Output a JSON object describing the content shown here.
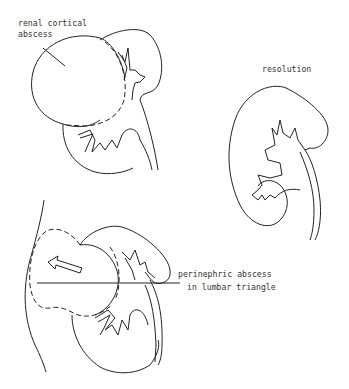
{
  "diagram": {
    "type": "medical illustration",
    "colors": {
      "line": "#222222",
      "text": "#333333",
      "background": "#ffffff"
    },
    "panels": [
      {
        "id": "top-left",
        "label": "renal cortical abscess"
      },
      {
        "id": "right",
        "label": "resolution"
      },
      {
        "id": "bottom-left",
        "label_line1": "perinephric  abscess",
        "label_line2": "in lumbar triangle"
      }
    ]
  }
}
